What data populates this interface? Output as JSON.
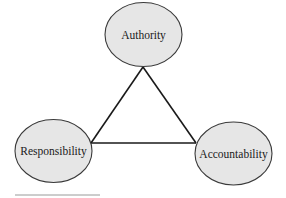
{
  "diagram": {
    "type": "triangle-relationship",
    "colors": {
      "node_fill": "#e6e6e6",
      "node_stroke": "#3a3a3a",
      "edge_stroke": "#1a1a1a",
      "rule": "#9a9a9a"
    },
    "nodes": [
      {
        "id": "authority",
        "label": "Authority"
      },
      {
        "id": "responsibility",
        "label": "Responsibility"
      },
      {
        "id": "accountability",
        "label": "Accountability"
      }
    ],
    "edges": [
      {
        "from": "authority",
        "to": "responsibility"
      },
      {
        "from": "authority",
        "to": "accountability"
      },
      {
        "from": "responsibility",
        "to": "accountability"
      }
    ]
  }
}
